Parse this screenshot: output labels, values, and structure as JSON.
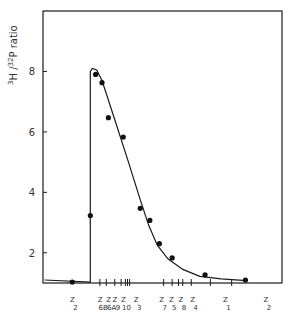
{
  "chart_data": {
    "type": "scatter",
    "title": "",
    "xlabel": "",
    "ylabel": "3H / 32P ratio",
    "ylabel_parts": {
      "sup1": "3",
      "base1": "H /",
      "sup2": "32",
      "base2": "P ratio"
    },
    "ylim": [
      1,
      10
    ],
    "yticks": [
      2,
      4,
      6,
      8
    ],
    "ytick_labels": [
      "2",
      "4",
      "6",
      "8"
    ],
    "x_note": "x axis is ordered zones (Z labels), positions in arbitrary units 0-100",
    "xlim": [
      0,
      100
    ],
    "xtick_positions": [
      23,
      26,
      30,
      33,
      35,
      36,
      37,
      53,
      57,
      60,
      62,
      66,
      75,
      85
    ],
    "zone_labels": [
      {
        "label": "Z",
        "sub": "2",
        "x": 12
      },
      {
        "label": "Z",
        "sub": "6B",
        "x": 25
      },
      {
        "label": "Z",
        "sub": "6A",
        "x": 29
      },
      {
        "label": "Z",
        "sub": "9",
        "x": 32
      },
      {
        "label": "Z",
        "sub": "10",
        "x": 36
      },
      {
        "label": "Z",
        "sub": "3",
        "x": 42
      },
      {
        "label": "Z",
        "sub": "7",
        "x": 54
      },
      {
        "label": "Z",
        "sub": "5",
        "x": 58.5
      },
      {
        "label": "Z",
        "sub": "8",
        "x": 63
      },
      {
        "label": "Z",
        "sub": "4",
        "x": 68.5
      },
      {
        "label": "Z",
        "sub": "1",
        "x": 84
      },
      {
        "label": "Z",
        "sub": "2",
        "x": 103
      }
    ],
    "series": [
      {
        "name": "measured",
        "points": [
          {
            "x": 10,
            "y": 1.03
          },
          {
            "x": 18.5,
            "y": 3.23
          },
          {
            "x": 21,
            "y": 7.9
          },
          {
            "x": 24,
            "y": 7.63
          },
          {
            "x": 27,
            "y": 6.47
          },
          {
            "x": 34,
            "y": 5.83
          },
          {
            "x": 42,
            "y": 3.47
          },
          {
            "x": 46.5,
            "y": 3.07
          },
          {
            "x": 51,
            "y": 2.3
          },
          {
            "x": 57,
            "y": 1.83
          },
          {
            "x": 72.5,
            "y": 1.27
          },
          {
            "x": 91.5,
            "y": 1.1
          }
        ]
      },
      {
        "name": "fitted-curve",
        "points": [
          {
            "x": -3,
            "y": 1.1
          },
          {
            "x": 18.5,
            "y": 1.03
          },
          {
            "x": 18.5,
            "y": 8.0
          },
          {
            "x": 19.5,
            "y": 8.1
          },
          {
            "x": 21.5,
            "y": 8.05
          },
          {
            "x": 24,
            "y": 7.7
          },
          {
            "x": 30,
            "y": 6.4
          },
          {
            "x": 36,
            "y": 5.1
          },
          {
            "x": 42,
            "y": 3.75
          },
          {
            "x": 46,
            "y": 2.9
          },
          {
            "x": 50,
            "y": 2.25
          },
          {
            "x": 55,
            "y": 1.8
          },
          {
            "x": 62,
            "y": 1.45
          },
          {
            "x": 70,
            "y": 1.22
          },
          {
            "x": 80,
            "y": 1.14
          },
          {
            "x": 92,
            "y": 1.08
          }
        ]
      }
    ]
  }
}
